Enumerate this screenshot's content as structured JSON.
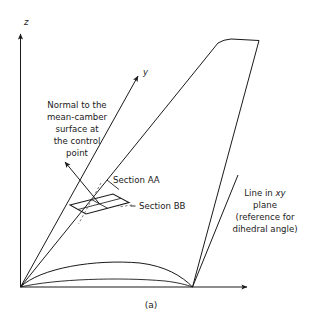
{
  "figure": {
    "caption": "(a)",
    "axes": {
      "z_label": "z",
      "y_label": "y"
    },
    "annotations": {
      "normal_note": {
        "lines": [
          "Normal to the",
          "mean-camber",
          "surface at",
          "the control",
          "point"
        ]
      },
      "section_aa": "Section AA",
      "section_bb": "Section BB",
      "dihedral_note": {
        "line1_prefix": "Line in ",
        "line1_italic": "xy",
        "line2": "plane",
        "line3": "(reference for",
        "line4": "dihedral angle)"
      }
    },
    "colors": {
      "ink": "#1a1a1a",
      "dash": "#5a5a5a",
      "background": "#ffffff"
    }
  }
}
